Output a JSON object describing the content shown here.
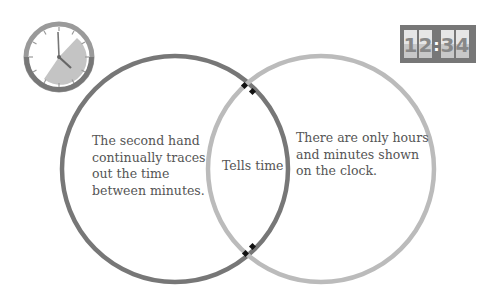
{
  "diagram": {
    "type": "venn",
    "left_set": {
      "icon": "analog-clock-icon",
      "text": [
        "The second hand",
        "continually traces",
        "out the time",
        "between minutes."
      ],
      "stroke_color": "#777777"
    },
    "right_set": {
      "icon": "digital-clock-icon",
      "digital_display": [
        "1",
        "2",
        ":",
        "3",
        "4"
      ],
      "text": [
        "There are only hours",
        "and minutes shown",
        "on the clock."
      ],
      "stroke_color": "#bbbbbb"
    },
    "intersection": {
      "text": "Tells time",
      "marker_color": "#111111"
    }
  }
}
